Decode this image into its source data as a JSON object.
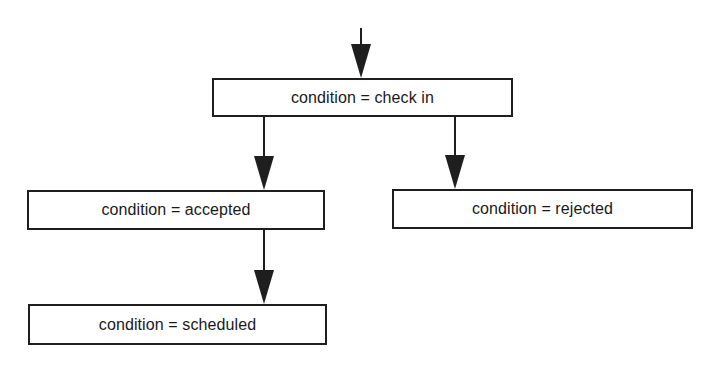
{
  "diagram": {
    "type": "flowchart",
    "colors": {
      "stroke": "#1e1e1e",
      "text": "#1a1a1a",
      "background": "#ffffff"
    },
    "nodes": [
      {
        "id": "check_in",
        "label": "condition = check in"
      },
      {
        "id": "accepted",
        "label": "condition = accepted"
      },
      {
        "id": "rejected",
        "label": "condition = rejected"
      },
      {
        "id": "scheduled",
        "label": "condition = scheduled"
      }
    ],
    "edges": [
      {
        "from": "entry",
        "to": "check_in"
      },
      {
        "from": "check_in",
        "to": "accepted"
      },
      {
        "from": "check_in",
        "to": "rejected"
      },
      {
        "from": "accepted",
        "to": "scheduled"
      }
    ]
  }
}
